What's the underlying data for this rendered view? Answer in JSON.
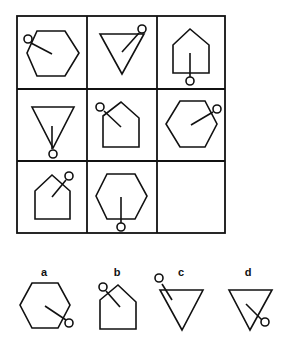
{
  "puzzle": {
    "type": "3x3 matrix reasoning",
    "grid": [
      [
        {
          "shape": "hexagon",
          "pointer_dir": "upper-left",
          "empty": false
        },
        {
          "shape": "inverted-triangle",
          "pointer_dir": "upper-right",
          "empty": false
        },
        {
          "shape": "pentagon-house",
          "pointer_dir": "down",
          "empty": false
        }
      ],
      [
        {
          "shape": "inverted-triangle",
          "pointer_dir": "down",
          "empty": false
        },
        {
          "shape": "pentagon-house",
          "pointer_dir": "upper-left",
          "empty": false
        },
        {
          "shape": "hexagon",
          "pointer_dir": "upper-right",
          "empty": false
        }
      ],
      [
        {
          "shape": "pentagon-house",
          "pointer_dir": "upper-right",
          "empty": false
        },
        {
          "shape": "hexagon",
          "pointer_dir": "down",
          "empty": false
        },
        {
          "shape": "",
          "pointer_dir": "",
          "empty": true
        }
      ]
    ],
    "options": [
      {
        "label": "a",
        "shape": "hexagon",
        "pointer_dir": "lower-right"
      },
      {
        "label": "b",
        "shape": "pentagon-house",
        "pointer_dir": "upper-left"
      },
      {
        "label": "c",
        "shape": "inverted-triangle",
        "pointer_dir": "upper-left"
      },
      {
        "label": "d",
        "shape": "inverted-triangle",
        "pointer_dir": "lower-right"
      }
    ]
  }
}
